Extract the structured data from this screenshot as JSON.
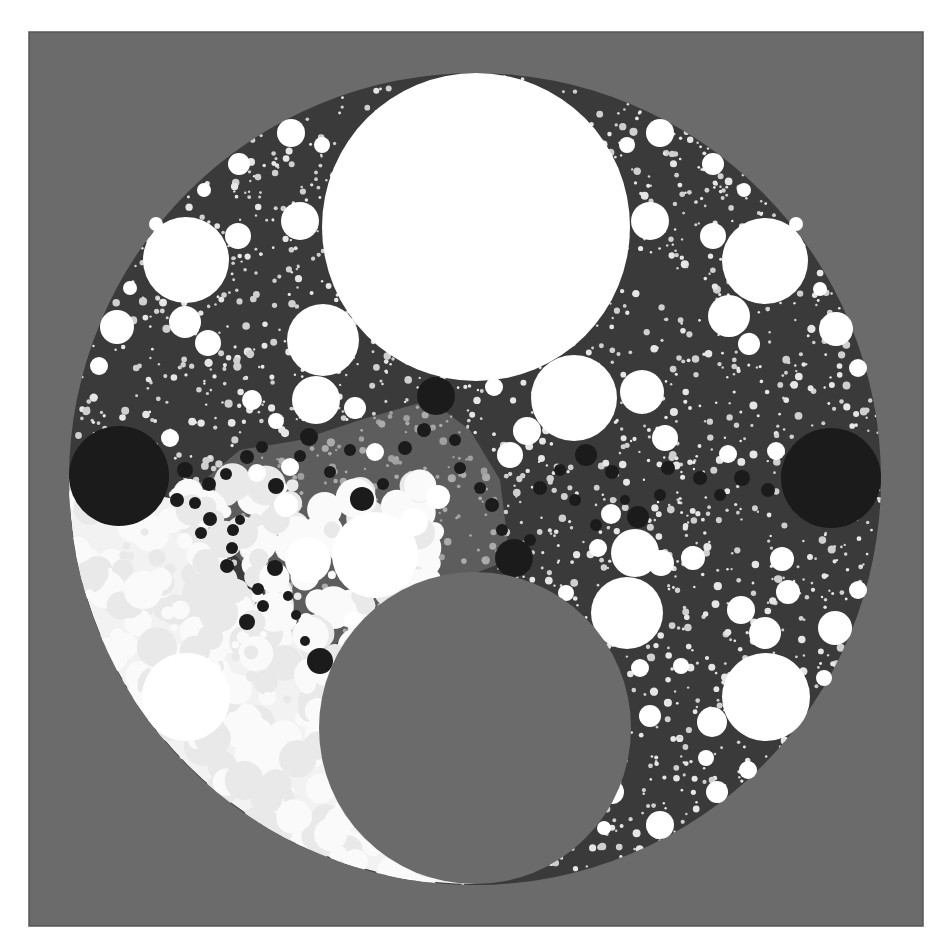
{
  "canvas": {
    "width": 949,
    "height": 945,
    "page_bg": "#ffffff"
  },
  "frame": {
    "x": 29,
    "y": 32,
    "w": 894,
    "h": 894,
    "fill": "#6b6b6b",
    "stroke": "#555555"
  },
  "colors": {
    "gray": "#6b6b6b",
    "white": "#ffffff",
    "black": "#1b1b1b",
    "packing_dark": "#3a3a3a",
    "packing_mid": "#7a7a7a",
    "packing_light": "#f2f2f2",
    "speckle": "#e6e6e6"
  },
  "outer_disk": {
    "cx": 475,
    "cy": 479,
    "r": 406
  },
  "light_crescent_hole": {
    "cx": 475,
    "cy": 728,
    "r": 156
  },
  "light_region_circle": {
    "cx": 250,
    "cy": 690,
    "r": 300
  },
  "gray_hole": {
    "cx": 475,
    "cy": 728,
    "r": 156
  },
  "white_circles": [
    {
      "cx": 476,
      "cy": 227,
      "r": 154
    },
    {
      "cx": 186,
      "cy": 260,
      "r": 43
    },
    {
      "cx": 765,
      "cy": 261,
      "r": 43
    },
    {
      "cx": 323,
      "cy": 340,
      "r": 36
    },
    {
      "cx": 574,
      "cy": 398,
      "r": 43
    },
    {
      "cx": 375,
      "cy": 555,
      "r": 43
    },
    {
      "cx": 627,
      "cy": 613,
      "r": 36
    },
    {
      "cx": 766,
      "cy": 697,
      "r": 44
    },
    {
      "cx": 186,
      "cy": 697,
      "r": 44
    },
    {
      "cx": 316,
      "cy": 400,
      "r": 24
    },
    {
      "cx": 308,
      "cy": 560,
      "r": 23
    },
    {
      "cx": 635,
      "cy": 553,
      "r": 24
    },
    {
      "cx": 117,
      "cy": 327,
      "r": 17
    },
    {
      "cx": 836,
      "cy": 329,
      "r": 17
    },
    {
      "cx": 291,
      "cy": 133,
      "r": 14
    },
    {
      "cx": 660,
      "cy": 133,
      "r": 14
    },
    {
      "cx": 239,
      "cy": 164,
      "r": 11
    },
    {
      "cx": 713,
      "cy": 164,
      "r": 11
    },
    {
      "cx": 650,
      "cy": 221,
      "r": 19
    },
    {
      "cx": 300,
      "cy": 221,
      "r": 19
    },
    {
      "cx": 238,
      "cy": 236,
      "r": 13
    },
    {
      "cx": 713,
      "cy": 236,
      "r": 13
    },
    {
      "cx": 185,
      "cy": 322,
      "r": 16
    },
    {
      "cx": 729,
      "cy": 316,
      "r": 21
    },
    {
      "cx": 208,
      "cy": 343,
      "r": 13
    },
    {
      "cx": 749,
      "cy": 344,
      "r": 11
    },
    {
      "cx": 642,
      "cy": 392,
      "r": 22
    },
    {
      "cx": 527,
      "cy": 431,
      "r": 14
    },
    {
      "cx": 510,
      "cy": 455,
      "r": 13
    },
    {
      "cx": 438,
      "cy": 497,
      "r": 12
    },
    {
      "cx": 414,
      "cy": 522,
      "r": 14
    },
    {
      "cx": 665,
      "cy": 438,
      "r": 13
    },
    {
      "cx": 693,
      "cy": 558,
      "r": 12
    },
    {
      "cx": 661,
      "cy": 563,
      "r": 13
    },
    {
      "cx": 741,
      "cy": 610,
      "r": 14
    },
    {
      "cx": 765,
      "cy": 633,
      "r": 16
    },
    {
      "cx": 835,
      "cy": 628,
      "r": 17
    },
    {
      "cx": 788,
      "cy": 592,
      "r": 12
    },
    {
      "cx": 712,
      "cy": 722,
      "r": 15
    },
    {
      "cx": 650,
      "cy": 716,
      "r": 11
    },
    {
      "cx": 717,
      "cy": 792,
      "r": 11
    },
    {
      "cx": 660,
      "cy": 825,
      "r": 14
    },
    {
      "cx": 612,
      "cy": 792,
      "r": 12
    },
    {
      "cx": 782,
      "cy": 559,
      "r": 12
    },
    {
      "cx": 858,
      "cy": 590,
      "r": 9
    },
    {
      "cx": 858,
      "cy": 368,
      "r": 9
    },
    {
      "cx": 99,
      "cy": 366,
      "r": 9
    },
    {
      "cx": 355,
      "cy": 408,
      "r": 11
    },
    {
      "cx": 375,
      "cy": 452,
      "r": 9
    },
    {
      "cx": 286,
      "cy": 505,
      "r": 12
    },
    {
      "cx": 290,
      "cy": 467,
      "r": 9
    },
    {
      "cx": 257,
      "cy": 473,
      "r": 9
    },
    {
      "cx": 611,
      "cy": 514,
      "r": 10
    },
    {
      "cx": 598,
      "cy": 548,
      "r": 9
    },
    {
      "cx": 566,
      "cy": 593,
      "r": 8
    },
    {
      "cx": 494,
      "cy": 387,
      "r": 9
    },
    {
      "cx": 252,
      "cy": 400,
      "r": 10
    },
    {
      "cx": 276,
      "cy": 421,
      "r": 8
    },
    {
      "cx": 776,
      "cy": 451,
      "r": 9
    },
    {
      "cx": 728,
      "cy": 454,
      "r": 9
    },
    {
      "cx": 170,
      "cy": 438,
      "r": 9
    },
    {
      "cx": 353,
      "cy": 620,
      "r": 9
    },
    {
      "cx": 322,
      "cy": 145,
      "r": 8
    },
    {
      "cx": 627,
      "cy": 145,
      "r": 8
    },
    {
      "cx": 744,
      "cy": 190,
      "r": 7
    },
    {
      "cx": 204,
      "cy": 190,
      "r": 7
    },
    {
      "cx": 156,
      "cy": 224,
      "r": 7
    },
    {
      "cx": 796,
      "cy": 224,
      "r": 7
    },
    {
      "cx": 130,
      "cy": 288,
      "r": 7
    },
    {
      "cx": 820,
      "cy": 289,
      "r": 7
    },
    {
      "cx": 824,
      "cy": 678,
      "r": 8
    },
    {
      "cx": 748,
      "cy": 770,
      "r": 9
    },
    {
      "cx": 706,
      "cy": 758,
      "r": 8
    },
    {
      "cx": 604,
      "cy": 828,
      "r": 7
    },
    {
      "cx": 681,
      "cy": 666,
      "r": 8
    },
    {
      "cx": 640,
      "cy": 668,
      "r": 9
    }
  ],
  "black_circles": [
    {
      "cx": 119,
      "cy": 476,
      "r": 50
    },
    {
      "cx": 831,
      "cy": 478,
      "r": 50
    },
    {
      "cx": 436,
      "cy": 396,
      "r": 19
    },
    {
      "cx": 514,
      "cy": 558,
      "r": 19
    },
    {
      "cx": 320,
      "cy": 661,
      "r": 13
    },
    {
      "cx": 362,
      "cy": 499,
      "r": 12
    },
    {
      "cx": 586,
      "cy": 455,
      "r": 11
    },
    {
      "cx": 638,
      "cy": 517,
      "r": 11
    },
    {
      "cx": 247,
      "cy": 622,
      "r": 8
    },
    {
      "cx": 275,
      "cy": 568,
      "r": 8
    },
    {
      "cx": 227,
      "cy": 566,
      "r": 7
    },
    {
      "cx": 309,
      "cy": 437,
      "r": 9
    },
    {
      "cx": 276,
      "cy": 486,
      "r": 8
    },
    {
      "cx": 209,
      "cy": 484,
      "r": 7
    },
    {
      "cx": 185,
      "cy": 470,
      "r": 8
    },
    {
      "cx": 247,
      "cy": 457,
      "r": 7
    },
    {
      "cx": 210,
      "cy": 519,
      "r": 7
    },
    {
      "cx": 177,
      "cy": 500,
      "r": 7
    },
    {
      "cx": 233,
      "cy": 530,
      "r": 6
    },
    {
      "cx": 201,
      "cy": 533,
      "r": 6
    },
    {
      "cx": 232,
      "cy": 548,
      "r": 6
    },
    {
      "cx": 258,
      "cy": 589,
      "r": 6
    },
    {
      "cx": 263,
      "cy": 606,
      "r": 6
    },
    {
      "cx": 296,
      "cy": 615,
      "r": 5
    },
    {
      "cx": 305,
      "cy": 641,
      "r": 5
    },
    {
      "cx": 405,
      "cy": 448,
      "r": 7
    },
    {
      "cx": 424,
      "cy": 430,
      "r": 7
    },
    {
      "cx": 330,
      "cy": 472,
      "r": 6
    },
    {
      "cx": 350,
      "cy": 450,
      "r": 6
    },
    {
      "cx": 383,
      "cy": 484,
      "r": 6
    },
    {
      "cx": 460,
      "cy": 468,
      "r": 6
    },
    {
      "cx": 492,
      "cy": 505,
      "r": 7
    },
    {
      "cx": 480,
      "cy": 488,
      "r": 6
    },
    {
      "cx": 540,
      "cy": 488,
      "r": 7
    },
    {
      "cx": 560,
      "cy": 470,
      "r": 6
    },
    {
      "cx": 612,
      "cy": 472,
      "r": 7
    },
    {
      "cx": 668,
      "cy": 468,
      "r": 7
    },
    {
      "cx": 700,
      "cy": 478,
      "r": 7
    },
    {
      "cx": 742,
      "cy": 478,
      "r": 8
    },
    {
      "cx": 768,
      "cy": 490,
      "r": 7
    },
    {
      "cx": 720,
      "cy": 495,
      "r": 6
    },
    {
      "cx": 660,
      "cy": 495,
      "r": 6
    },
    {
      "cx": 530,
      "cy": 540,
      "r": 6
    },
    {
      "cx": 502,
      "cy": 530,
      "r": 6
    },
    {
      "cx": 262,
      "cy": 447,
      "r": 6
    },
    {
      "cx": 300,
      "cy": 456,
      "r": 6
    },
    {
      "cx": 226,
      "cy": 474,
      "r": 6
    },
    {
      "cx": 195,
      "cy": 503,
      "r": 6
    },
    {
      "cx": 240,
      "cy": 520,
      "r": 5
    },
    {
      "cx": 288,
      "cy": 596,
      "r": 5
    },
    {
      "cx": 455,
      "cy": 440,
      "r": 6
    },
    {
      "cx": 575,
      "cy": 500,
      "r": 6
    },
    {
      "cx": 596,
      "cy": 525,
      "r": 6
    },
    {
      "cx": 625,
      "cy": 500,
      "r": 5
    }
  ],
  "speckle": {
    "seed": 7,
    "count": 2600,
    "min_r": 1.2,
    "max_r": 4.2
  },
  "light_speckle": {
    "seed": 11,
    "count": 520,
    "min_r": 3,
    "max_r": 20
  }
}
